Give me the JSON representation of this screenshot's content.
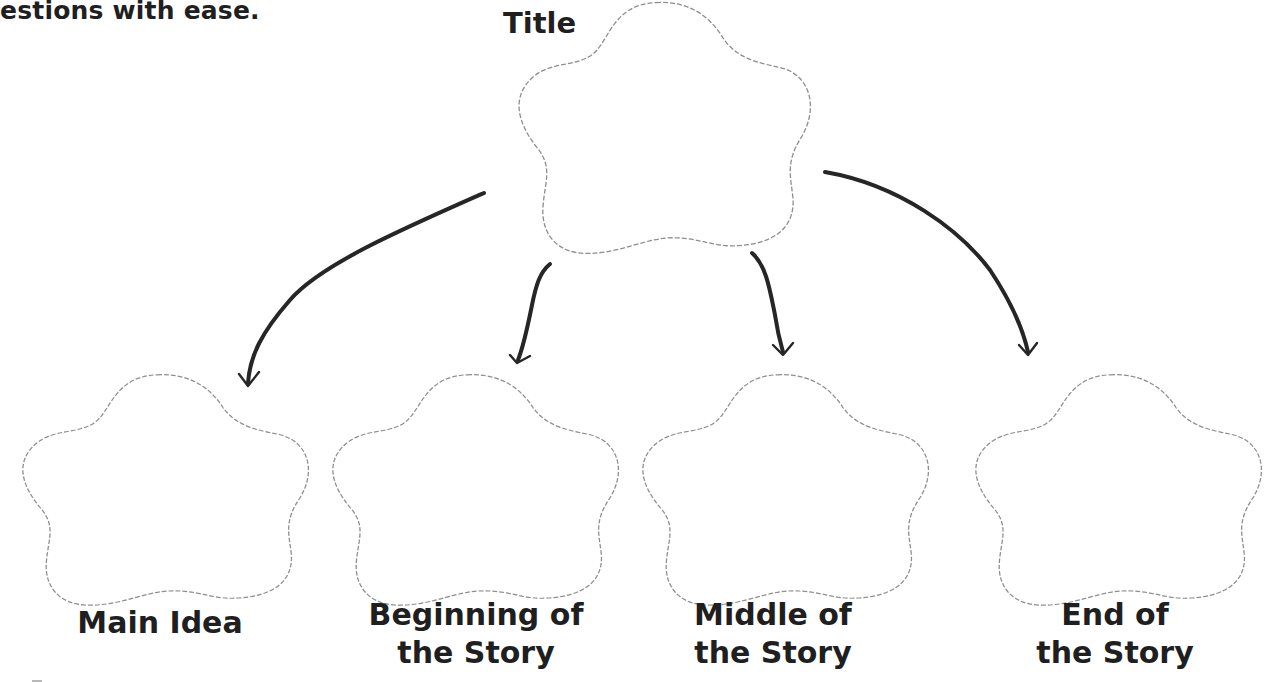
{
  "page": {
    "intro_fragment": "estions with ease."
  },
  "diagram": {
    "type": "story-map",
    "outline_color": "#8e8e8e",
    "arrow_color": "#262626",
    "text_color": "#1f1f1f",
    "root": {
      "label": "Title"
    },
    "children": [
      {
        "label_line1": "Main Idea",
        "label_line2": ""
      },
      {
        "label_line1": "Beginning of",
        "label_line2": "the Story"
      },
      {
        "label_line1": "Middle of",
        "label_line2": "the Story"
      },
      {
        "label_line1": "End of",
        "label_line2": "the Story"
      }
    ],
    "edges": [
      {
        "from": "Title",
        "to": "Main Idea"
      },
      {
        "from": "Title",
        "to": "Beginning of the Story"
      },
      {
        "from": "Title",
        "to": "Middle of the Story"
      },
      {
        "from": "Title",
        "to": "End of the Story"
      }
    ]
  }
}
